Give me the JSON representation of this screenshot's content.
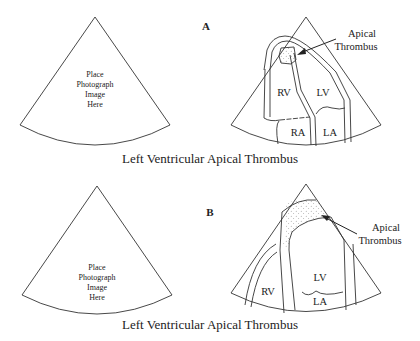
{
  "figure": {
    "panels": [
      {
        "id": "A",
        "label": "A",
        "placeholder_lines": [
          "Place",
          "Photograph",
          "Image",
          "Here"
        ],
        "chambers": {
          "rv": "RV",
          "lv": "LV",
          "ra": "RA",
          "la": "LA"
        },
        "annotation_lines": [
          "Apical",
          "Thrombus"
        ],
        "caption": "Left Ventricular Apical Thrombus"
      },
      {
        "id": "B",
        "label": "B",
        "placeholder_lines": [
          "Place",
          "Photograph",
          "Image",
          "Here"
        ],
        "chambers": {
          "rv": "RV",
          "lv": "LV",
          "la": "LA"
        },
        "annotation_lines": [
          "Apical",
          "Thrombus"
        ],
        "caption": "Left Ventricular Apical Thrombus"
      }
    ],
    "colors": {
      "line": "#333333",
      "text": "#222222",
      "background": "#ffffff"
    }
  }
}
